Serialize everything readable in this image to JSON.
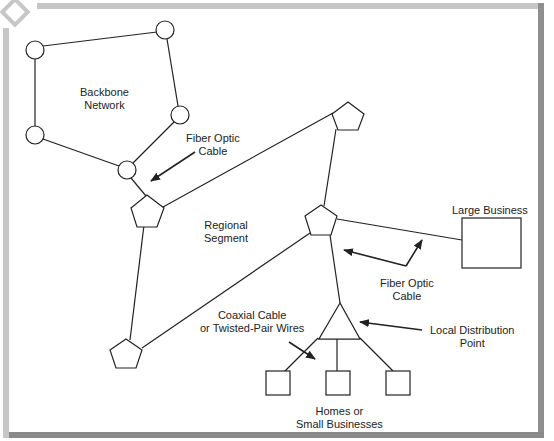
{
  "diagram": {
    "colors": {
      "line": "#222222",
      "frame_light": "#c6c6c6",
      "frame_dark": "#8f8f8f",
      "background": "#ffffff"
    },
    "labels": {
      "backbone": [
        "Backbone",
        "Network"
      ],
      "fiber_top": [
        "Fiber Optic",
        "Cable"
      ],
      "regional": [
        "Regional",
        "Segment"
      ],
      "large_business": "Large Business",
      "fiber_bottom": [
        "Fiber Optic",
        "Cable"
      ],
      "coaxial": [
        "Coaxial Cable",
        "or Twisted-Pair Wires"
      ],
      "local_distribution": [
        "Local Distribution",
        "Point"
      ],
      "homes": [
        "Homes or",
        "Small Businesses"
      ]
    },
    "nodes": {
      "backbone_circles": [
        [
          35,
          50
        ],
        [
          165,
          30
        ],
        [
          180,
          115
        ],
        [
          35,
          135
        ],
        [
          127,
          170
        ]
      ],
      "pentagons": [
        [
          147,
          211
        ],
        [
          321,
          221
        ],
        [
          348,
          118
        ],
        [
          126,
          354
        ]
      ],
      "distribution_triangle": [
        340,
        303
      ],
      "homes_boxes": 3,
      "large_business_box": 1
    }
  }
}
